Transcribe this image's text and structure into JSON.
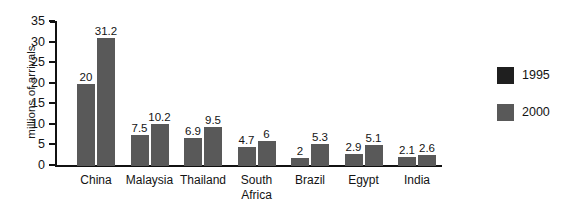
{
  "chart_data": {
    "type": "bar",
    "title": "",
    "xlabel": "",
    "ylabel": "millions of arrivals",
    "ylim": [
      0,
      35
    ],
    "yticks": [
      0,
      5,
      10,
      15,
      20,
      25,
      30,
      35
    ],
    "ytick_labels": [
      "0",
      "5",
      "10",
      "15",
      "20",
      "25",
      "30",
      "35"
    ],
    "grid": false,
    "legend_position": "right",
    "categories": [
      "China",
      "Malaysia",
      "Thailand",
      "South Africa",
      "Brazil",
      "Egypt",
      "India"
    ],
    "category_lines": [
      [
        "China"
      ],
      [
        "Malaysia"
      ],
      [
        "Thailand"
      ],
      [
        "South",
        "Africa"
      ],
      [
        "Brazil"
      ],
      [
        "Egypt"
      ],
      [
        "India"
      ]
    ],
    "series": [
      {
        "name": "1995",
        "color": "#1f1f1f",
        "bar_color": "#595959",
        "values": [
          20,
          7.5,
          6.9,
          4.7,
          2,
          2.9,
          2.1
        ],
        "value_labels": [
          "20",
          "7.5",
          "6.9",
          "4.7",
          "2",
          "2.9",
          "2.1"
        ]
      },
      {
        "name": "2000",
        "color": "#595959",
        "bar_color": "#595959",
        "values": [
          31.2,
          10.2,
          9.5,
          6,
          5.3,
          5.1,
          2.6
        ],
        "value_labels": [
          "31.2",
          "10.2",
          "9.5",
          "6",
          "5.3",
          "5.1",
          "2.6"
        ]
      }
    ]
  },
  "legend": {
    "items": [
      {
        "label": "1995",
        "color": "#1f1f1f"
      },
      {
        "label": "2000",
        "color": "#595959"
      }
    ]
  }
}
